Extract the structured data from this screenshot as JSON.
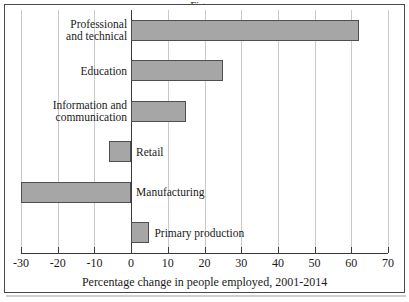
{
  "figure": {
    "background_color": "#ffffff",
    "frame_color": "#4a4a4a",
    "title_cropped": "Figure"
  },
  "chart_data": {
    "type": "bar",
    "orientation": "horizontal",
    "title": "",
    "xlabel": "Percentage change in people employed, 2001-2014",
    "ylabel": "",
    "xlim": [
      -30,
      70
    ],
    "xticks": [
      -30,
      -20,
      -10,
      0,
      10,
      20,
      30,
      40,
      50,
      60,
      70
    ],
    "xtick_labels": [
      "-30",
      "-20",
      "-10",
      "0",
      "10",
      "20",
      "30",
      "40",
      "50",
      "60",
      "70"
    ],
    "grid": "vertical",
    "legend": "none",
    "categories": [
      "Professional\nand technical",
      "Education",
      "Information and\ncommunication",
      "Retail",
      "Manufacturing",
      "Primary production"
    ],
    "category_labels_plain": [
      "Professional and technical",
      "Education",
      "Information and communication",
      "Retail",
      "Manufacturing",
      "Primary production"
    ],
    "values": [
      62,
      25,
      15,
      -6,
      -30,
      5
    ],
    "bar_fill_color": "#a6a6a6",
    "bar_edge_color": "#4f4f4f",
    "gridline_color": "#c9c9c9",
    "axis_color": "#3a3a3a"
  },
  "axis": {
    "title": "Percentage change in people employed, 2001-2014",
    "tick_labels": [
      "-30",
      "-20",
      "-10",
      "0",
      "10",
      "20",
      "30",
      "40",
      "50",
      "60",
      "70"
    ]
  },
  "bars": [
    {
      "label": "Professional\nand technical",
      "value": 62,
      "label_side": "left"
    },
    {
      "label": "Education",
      "value": 25,
      "label_side": "left"
    },
    {
      "label": "Information and\ncommunication",
      "value": 15,
      "label_side": "left"
    },
    {
      "label": "Retail",
      "value": -6,
      "label_side": "right"
    },
    {
      "label": "Manufacturing",
      "value": -30,
      "label_side": "right"
    },
    {
      "label": "Primary production",
      "value": 5,
      "label_side": "right"
    }
  ]
}
